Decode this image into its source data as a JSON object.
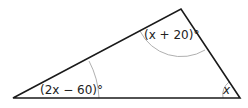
{
  "diagram": {
    "type": "triangle",
    "angles": {
      "left": "(2x − 60)°",
      "top": "(x + 20)°",
      "right": "x"
    },
    "colors": {
      "stroke": "#1a1a1a",
      "arc": "#b0b0b0"
    }
  }
}
